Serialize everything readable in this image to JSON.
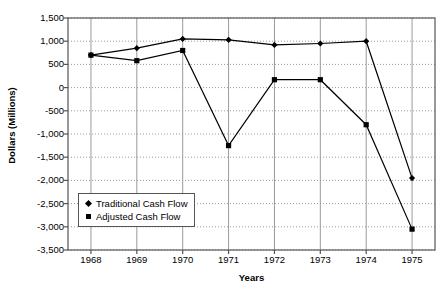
{
  "chart_data": {
    "type": "line",
    "title": "",
    "xlabel": "Years",
    "ylabel": "Dollars (Millions)",
    "categories": [
      "1968",
      "1969",
      "1970",
      "1971",
      "1972",
      "1973",
      "1974",
      "1975"
    ],
    "x": [
      1968,
      1969,
      1970,
      1971,
      1972,
      1973,
      1974,
      1975
    ],
    "xlim": [
      1967.5,
      1975.5
    ],
    "ylim": [
      -3500,
      1500
    ],
    "ytick_values": [
      1500,
      1000,
      500,
      0,
      -500,
      -1000,
      -1500,
      -2000,
      -2500,
      -3000,
      -3500
    ],
    "ytick_labels": [
      "1,500",
      "1,000",
      "500",
      "0",
      "-500",
      "-1,000",
      "-1,500",
      "-2,000",
      "-2,500",
      "-3,000",
      "-3,500"
    ],
    "xtick_labels": [
      "1968",
      "1969",
      "1970",
      "1971",
      "1972",
      "1973",
      "1974",
      "1975"
    ],
    "grid": true,
    "grid_style": "dotted",
    "legend_position": "lower-left-inside",
    "series": [
      {
        "name": "Traditional Cash Flow",
        "marker": "diamond",
        "color": "#000000",
        "values": [
          700,
          850,
          1050,
          1030,
          920,
          950,
          1000,
          -1950
        ]
      },
      {
        "name": "Adjusted Cash Flow",
        "marker": "square",
        "color": "#000000",
        "values": [
          700,
          580,
          800,
          -1250,
          170,
          170,
          -800,
          -3050
        ]
      }
    ]
  },
  "legend": {
    "items": [
      {
        "label": "Traditional Cash Flow",
        "marker": "diamond"
      },
      {
        "label": "Adjusted Cash Flow",
        "marker": "square"
      }
    ]
  },
  "colors": {
    "axis": "#555555",
    "grid": "#9a9a9a",
    "series": "#000000",
    "background": "#ffffff"
  }
}
